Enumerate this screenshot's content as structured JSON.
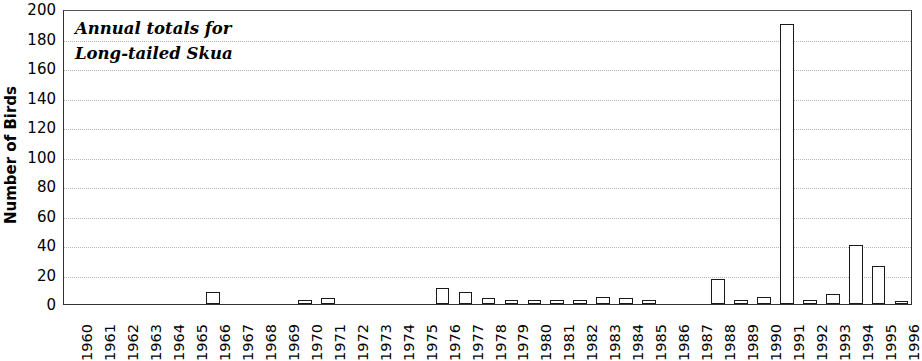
{
  "chart_data": {
    "type": "bar",
    "title": "",
    "annotation": [
      "Annual totals for",
      "Long-tailed Skua"
    ],
    "xlabel": "",
    "ylabel": "Number of Birds",
    "ylim": [
      0,
      200
    ],
    "ytick_step": 20,
    "yticks": [
      0,
      20,
      40,
      60,
      80,
      100,
      120,
      140,
      160,
      180,
      200
    ],
    "grid": true,
    "legend": false,
    "bar_fill_color": "#ffffff",
    "bar_edge_color": "#1a1a1a",
    "gridline_color": "#b6b6b6",
    "axis_color": "#333333",
    "categories": [
      "1960",
      "1961",
      "1962",
      "1963",
      "1964",
      "1965",
      "1966",
      "1967",
      "1968",
      "1969",
      "1970",
      "1971",
      "1972",
      "1973",
      "1974",
      "1975",
      "1976",
      "1977",
      "1978",
      "1979",
      "1980",
      "1981",
      "1982",
      "1983",
      "1984",
      "1985",
      "1986",
      "1987",
      "1988",
      "1989",
      "1990",
      "1991",
      "1992",
      "1993",
      "1994",
      "1995",
      "1996"
    ],
    "values": [
      0,
      0,
      0,
      0,
      0,
      0,
      8,
      0,
      0,
      0,
      3,
      4,
      0,
      0,
      0,
      0,
      11,
      8,
      4,
      3,
      3,
      3,
      3,
      5,
      4,
      3,
      0,
      0,
      17,
      3,
      5,
      190,
      3,
      7,
      40,
      26,
      2
    ]
  }
}
